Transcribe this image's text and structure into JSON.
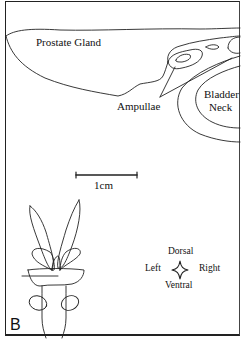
{
  "figure": {
    "panel_label": "B",
    "labels": {
      "prostate": "Prostate Gland",
      "ampullae": "Ampullae",
      "bladder_line1": "Bladder",
      "bladder_line2": "Neck"
    },
    "scale_bar": {
      "label": "1cm"
    },
    "orientation": {
      "top": "Dorsal",
      "bottom": "Ventral",
      "left": "Left",
      "right": "Right"
    }
  }
}
